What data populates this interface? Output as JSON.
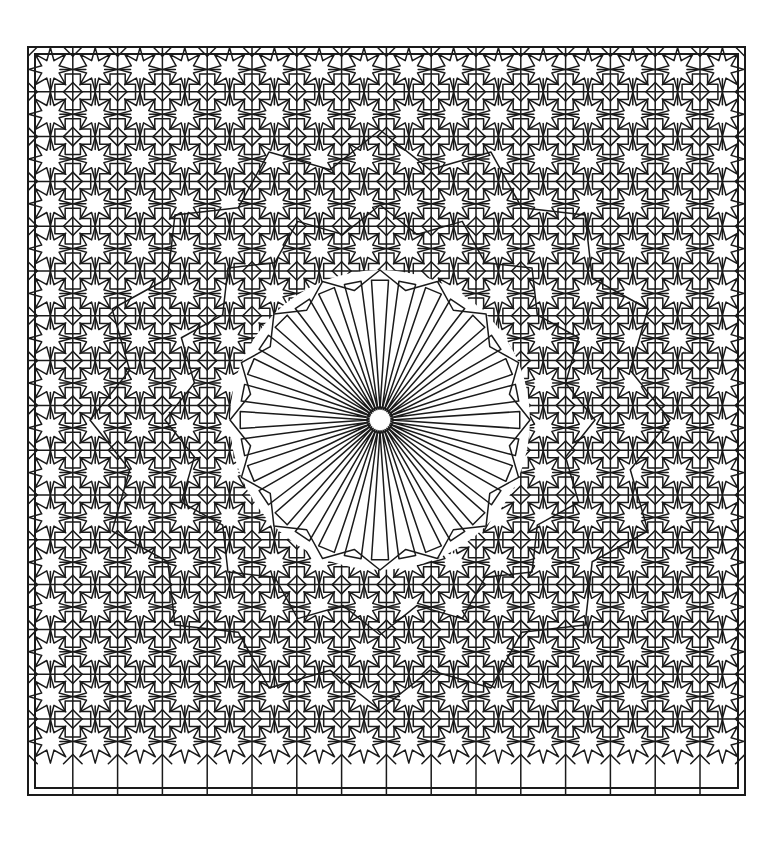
{
  "artwork": {
    "title": "Islamic Geometric Star Pattern",
    "style": "girih-zellige line drawing",
    "description": "Monochrome line-art tiling of interlocking eight-pointed stars with a large central radiating rosette",
    "background_color": "#ffffff",
    "stroke_color": "#1a1a1a",
    "stroke_width": 1.5,
    "canvas": {
      "width": 760,
      "height": 841
    }
  },
  "frame": {
    "name": "outer-border",
    "x": 28,
    "y": 47,
    "width": 717,
    "height": 748,
    "stroke_color": "#1a1a1a",
    "stroke_width": 2,
    "inset_offset": 7
  },
  "grid": {
    "columns": 16,
    "rows": 16,
    "cell_size": 44.8,
    "origin_x": 28,
    "origin_y": 47,
    "motif": "eight-point-star-rosette"
  },
  "rosette": {
    "name": "central-rosette",
    "center_x": 380,
    "center_y": 420,
    "ray_count": 32,
    "inner_radius": 16,
    "outer_radius": 140,
    "petal_outer_radius": 150,
    "hub_radius": 15
  },
  "rings": [
    {
      "name": "inner-kite-ring",
      "radius": 150,
      "points": 16
    },
    {
      "name": "mid-star-ring",
      "radius": 215,
      "points": 16
    },
    {
      "name": "outer-star-ring",
      "radius": 290,
      "points": 16
    }
  ],
  "palette": {
    "line": "#1a1a1a",
    "paper": "#ffffff",
    "margin": "#ffffff"
  },
  "chart_data": {
    "type": "diagram",
    "elements": [
      "outer frame",
      "16x16 star grid",
      "central 32-ray rosette"
    ]
  }
}
